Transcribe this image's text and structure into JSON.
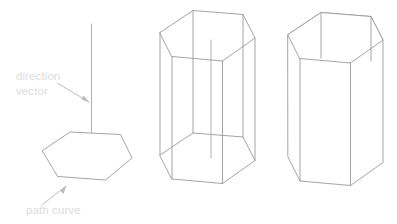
{
  "diagram": {
    "background_color": "#ffffff",
    "line_color": "#9a9a9a",
    "axis_color": "#a8a8a8",
    "label_color": "#dcdcdc",
    "leader_color": "#b4b4b4"
  },
  "annotations": {
    "direction_vector": {
      "line1": "direction",
      "line2": "vector"
    },
    "path_curve": {
      "line1": "path curve"
    }
  },
  "figures": [
    {
      "name": "path-curve-with-direction-vector",
      "description": "Hexagonal path curve with a vertical direction vector passing through it"
    },
    {
      "name": "wireframe-extruded-prism",
      "description": "Hexagonal prism extruded along the direction vector, shown as wireframe with hidden edges visible and the centre axis line"
    },
    {
      "name": "solid-extruded-prism",
      "description": "Hexagonal prism with hidden lines removed"
    }
  ]
}
